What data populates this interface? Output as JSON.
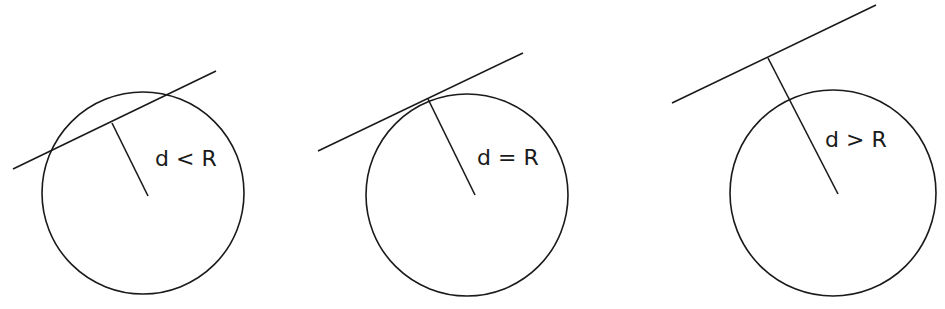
{
  "panels": [
    {
      "label": "d < R",
      "case": "intersecting",
      "circle": {
        "cx": 143,
        "cy": 193,
        "r": 101
      },
      "line": {
        "x1": 13,
        "y1": 169,
        "x2": 216,
        "y2": 71
      },
      "perpendicular": {
        "x1": 112,
        "y1": 123,
        "x2": 148,
        "y2": 196
      },
      "text_pos": {
        "x": 155,
        "y": 166
      }
    },
    {
      "label": "d = R",
      "case": "tangent",
      "circle": {
        "cx": 467,
        "cy": 195,
        "r": 101
      },
      "line": {
        "x1": 318,
        "y1": 151,
        "x2": 523,
        "y2": 53
      },
      "perpendicular": {
        "x1": 428,
        "y1": 99,
        "x2": 475,
        "y2": 195
      },
      "text_pos": {
        "x": 477,
        "y": 165
      }
    },
    {
      "label": "d > R",
      "case": "separate",
      "circle": {
        "cx": 833,
        "cy": 193,
        "r": 103
      },
      "line": {
        "x1": 672,
        "y1": 103,
        "x2": 876,
        "y2": 5
      },
      "perpendicular": {
        "x1": 768,
        "y1": 58,
        "x2": 838,
        "y2": 194
      },
      "text_pos": {
        "x": 825,
        "y": 147
      }
    }
  ]
}
